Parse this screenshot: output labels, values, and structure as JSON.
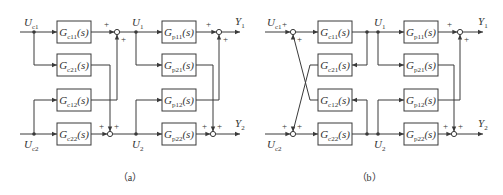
{
  "figure": {
    "panels": [
      {
        "id": "a",
        "caption": "（a）",
        "inputs": [
          {
            "main": "U",
            "sub": "c1"
          },
          {
            "main": "U",
            "sub": "c2"
          }
        ],
        "controller_blocks": [
          {
            "main": "G",
            "sub": "c11",
            "arg": "(s)"
          },
          {
            "main": "G",
            "sub": "c21",
            "arg": "(s)"
          },
          {
            "main": "G",
            "sub": "c12",
            "arg": "(s)"
          },
          {
            "main": "G",
            "sub": "c22",
            "arg": "(s)"
          }
        ],
        "intermediate": [
          {
            "main": "U",
            "sub": "1"
          },
          {
            "main": "U",
            "sub": "2"
          }
        ],
        "plant_blocks": [
          {
            "main": "G",
            "sub": "p11",
            "arg": "(s)"
          },
          {
            "main": "G",
            "sub": "p21",
            "arg": "(s)"
          },
          {
            "main": "G",
            "sub": "p12",
            "arg": "(s)"
          },
          {
            "main": "G",
            "sub": "p22",
            "arg": "(s)"
          }
        ],
        "outputs": [
          {
            "main": "Y",
            "sub": "1"
          },
          {
            "main": "Y",
            "sub": "2"
          }
        ],
        "sign": "+"
      },
      {
        "id": "b",
        "caption": "（b）",
        "inputs": [
          {
            "main": "U",
            "sub": "c1"
          },
          {
            "main": "U",
            "sub": "c2"
          }
        ],
        "controller_blocks": [
          {
            "main": "G",
            "sub": "c11",
            "arg": "(s)"
          },
          {
            "main": "G",
            "sub": "c21",
            "arg": "(s)"
          },
          {
            "main": "G",
            "sub": "c12",
            "arg": "(s)"
          },
          {
            "main": "G",
            "sub": "c22",
            "arg": "(s)"
          }
        ],
        "intermediate": [
          {
            "main": "U",
            "sub": "1"
          },
          {
            "main": "U",
            "sub": "2"
          }
        ],
        "plant_blocks": [
          {
            "main": "G",
            "sub": "p11",
            "arg": "(s)"
          },
          {
            "main": "G",
            "sub": "p21",
            "arg": "(s)"
          },
          {
            "main": "G",
            "sub": "p12",
            "arg": "(s)"
          },
          {
            "main": "G",
            "sub": "p22",
            "arg": "(s)"
          }
        ],
        "outputs": [
          {
            "main": "Y",
            "sub": "1"
          },
          {
            "main": "Y",
            "sub": "2"
          }
        ],
        "sign": "+"
      }
    ]
  }
}
